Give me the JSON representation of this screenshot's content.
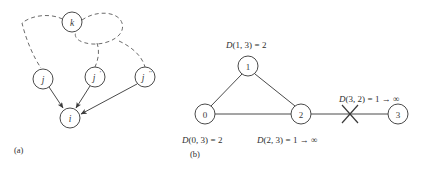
{
  "figure": {
    "background_color": "#ffffff",
    "ink_color": "#4a4a4a",
    "panels": [
      {
        "id": "panel-a",
        "label": "(a)",
        "description": "directed graph with node i receiving arrows from j, j prime and j double prime, and dashed paths through k",
        "nodes": [
          {
            "id": "k",
            "label": "k",
            "cx": 72,
            "cy": 22,
            "r": 10
          },
          {
            "id": "j",
            "label": "j",
            "cx": 43,
            "cy": 79,
            "r": 10
          },
          {
            "id": "jp",
            "label": "j",
            "prime": "'",
            "cx": 95,
            "cy": 77,
            "r": 10
          },
          {
            "id": "jpp",
            "label": "j",
            "prime": "''",
            "cx": 145,
            "cy": 77,
            "r": 10
          },
          {
            "id": "i",
            "label": "i",
            "cx": 70,
            "cy": 118,
            "r": 10
          }
        ],
        "solid_arrows": [
          {
            "from": "j",
            "to": "i"
          },
          {
            "from": "jp",
            "to": "i"
          },
          {
            "from": "jpp",
            "to": "i"
          }
        ],
        "dashed_paths": [
          {
            "from": "k",
            "to": "j",
            "via": "left"
          },
          {
            "from": "k",
            "to": "jp",
            "via": "right-loop"
          },
          {
            "from": "k",
            "to": "jpp",
            "via": "right-loop"
          }
        ]
      },
      {
        "id": "panel-b",
        "label": "(b)",
        "description": "four node network 0-1-2-3 with broken link between 2 and 3",
        "nodes": [
          {
            "id": "0",
            "label": "0",
            "cx": 205,
            "cy": 114,
            "r": 10
          },
          {
            "id": "1",
            "label": "1",
            "cx": 248,
            "cy": 66,
            "r": 10
          },
          {
            "id": "2",
            "label": "2",
            "cx": 301,
            "cy": 114,
            "r": 10
          },
          {
            "id": "3",
            "label": "3",
            "cx": 398,
            "cy": 114,
            "r": 10
          }
        ],
        "links": [
          {
            "from": "0",
            "to": "1",
            "state": "up"
          },
          {
            "from": "1",
            "to": "2",
            "state": "up"
          },
          {
            "from": "0",
            "to": "2",
            "state": "up"
          },
          {
            "from": "2",
            "to": "3",
            "state": "cut"
          }
        ],
        "cut_marker": {
          "x": 350,
          "y": 114,
          "size": 9,
          "name": "link-failure-x"
        },
        "distance_labels": [
          {
            "id": "d-1-3",
            "prefix": "D",
            "args": "(1, 3)",
            "equals": "=",
            "value": "2",
            "x": 226,
            "y": 45
          },
          {
            "id": "d-0-3",
            "prefix": "D",
            "args": "(0, 3)",
            "equals": "=",
            "value": "2",
            "x": 182,
            "y": 140
          },
          {
            "id": "d-2-3",
            "prefix": "D",
            "args": "(2, 3)",
            "equals": "=",
            "value": "1 → ∞",
            "x": 257,
            "y": 140
          },
          {
            "id": "d-3-2",
            "prefix": "D",
            "args": "(3, 2)",
            "equals": "=",
            "value": "1 → ∞",
            "x": 339,
            "y": 99
          }
        ]
      }
    ],
    "panel_label_a": {
      "text": "(a)",
      "x": 14,
      "y": 150
    },
    "panel_label_b": {
      "text": "(b)",
      "x": 190,
      "y": 154
    }
  }
}
